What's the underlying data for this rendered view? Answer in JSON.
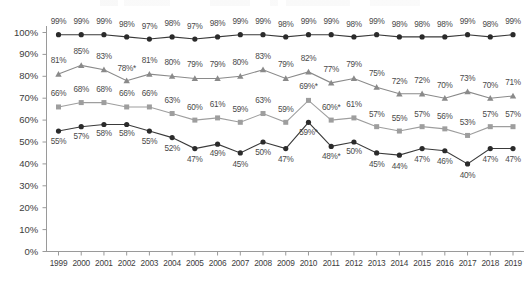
{
  "chart_data": {
    "type": "line",
    "title": "",
    "subtitle": "",
    "xlabel": "",
    "ylabel": "",
    "ylim": [
      0,
      100
    ],
    "ytick_labels": [
      "0%",
      "10%",
      "20%",
      "30%",
      "40%",
      "50%",
      "60%",
      "70%",
      "80%",
      "90%",
      "100%"
    ],
    "ytick_values": [
      0,
      10,
      20,
      30,
      40,
      50,
      60,
      70,
      80,
      90,
      100
    ],
    "grid": false,
    "legend_position": "top",
    "categories": [
      "1999",
      "2000",
      "2001",
      "2002",
      "2003",
      "2004",
      "2005",
      "2006",
      "2007",
      "2008",
      "2009",
      "2010",
      "2011",
      "2012",
      "2013",
      "2014",
      "2015",
      "2016",
      "2017",
      "2018",
      "2019"
    ],
    "series": [
      {
        "name": "series-1",
        "marker": "circle",
        "color": "#2b2b2b",
        "line_color": "#3a3a3a",
        "values": [
          99,
          99,
          99,
          98,
          97,
          98,
          97,
          98,
          99,
          99,
          98,
          99,
          99,
          98,
          99,
          98,
          98,
          98,
          99,
          98,
          99
        ],
        "labels": [
          "99%",
          "99%",
          "99%",
          "98%",
          "97%",
          "98%",
          "97%",
          "98%",
          "99%",
          "99%",
          "98%",
          "99%",
          "99%",
          "98%",
          "99%",
          "98%",
          "98%",
          "98%",
          "99%",
          "98%",
          "99%"
        ],
        "label_offsets_y": [
          -13,
          -13,
          -13,
          -12,
          -12,
          -13,
          -12,
          -13,
          -13,
          -13,
          -12,
          -13,
          -13,
          -12,
          -13,
          -12,
          -12,
          -12,
          -13,
          -12,
          -13
        ]
      },
      {
        "name": "series-2",
        "marker": "triangle",
        "color": "#8a8a8a",
        "line_color": "#8a8a8a",
        "values": [
          81,
          85,
          83,
          78,
          81,
          80,
          79,
          79,
          80,
          83,
          79,
          82,
          77,
          79,
          75,
          72,
          72,
          70,
          73,
          70,
          71
        ],
        "labels": [
          "81%",
          "85%",
          "83%",
          "78%*",
          "81%",
          "80%",
          "79%",
          "79%",
          "80%",
          "83%",
          "79%",
          "82%",
          "77%",
          "79%",
          "75%",
          "72%",
          "72%",
          "70%",
          "73%",
          "70%",
          "71%"
        ],
        "label_offsets_y": [
          -13,
          -13,
          -13,
          -12,
          -13,
          -13,
          -13,
          -13,
          -13,
          -13,
          -13,
          -13,
          -13,
          -13,
          -13,
          -12,
          -13,
          -12,
          -13,
          -12,
          -13
        ]
      },
      {
        "name": "series-3",
        "marker": "square",
        "color": "#9e9e9e",
        "line_color": "#9e9e9e",
        "values": [
          66,
          68,
          68,
          66,
          66,
          63,
          60,
          61,
          59,
          63,
          59,
          69,
          60,
          61,
          57,
          55,
          57,
          56,
          53,
          57,
          57
        ],
        "labels": [
          "66%",
          "68%",
          "68%",
          "66%",
          "66%",
          "63%",
          "60%",
          "61%",
          "59%",
          "63%",
          "59%",
          "69%*",
          "60%*",
          "61%",
          "57%",
          "55%",
          "57%",
          "56%",
          "53%",
          "57%",
          "57%"
        ],
        "label_offsets_y": [
          -13,
          -13,
          -13,
          -13,
          -13,
          -13,
          -12,
          -13,
          -12,
          -13,
          -12,
          -13,
          -12,
          -13,
          -12,
          -12,
          -12,
          -12,
          -12,
          -12,
          -12
        ]
      },
      {
        "name": "series-4",
        "marker": "circle",
        "color": "#2b2b2b",
        "line_color": "#3a3a3a",
        "values": [
          55,
          57,
          58,
          58,
          55,
          52,
          47,
          49,
          45,
          50,
          47,
          59,
          48,
          50,
          45,
          44,
          47,
          46,
          40,
          47,
          47
        ],
        "labels": [
          "55%",
          "57%",
          "58%",
          "58%",
          "55%",
          "52%",
          "47%",
          "49%",
          "45%",
          "50%",
          "47%",
          "59%*",
          "48%*",
          "50%",
          "45%",
          "44%",
          "47%",
          "46%",
          "40%",
          "47%",
          "47%"
        ],
        "label_offsets_y": [
          11,
          10,
          10,
          10,
          11,
          11,
          11,
          10,
          12,
          11,
          11,
          11,
          11,
          10,
          12,
          12,
          11,
          11,
          12,
          11,
          11
        ]
      }
    ]
  },
  "axis": {
    "y_axis_name": "percent-axis",
    "x_axis_name": "year-axis"
  }
}
